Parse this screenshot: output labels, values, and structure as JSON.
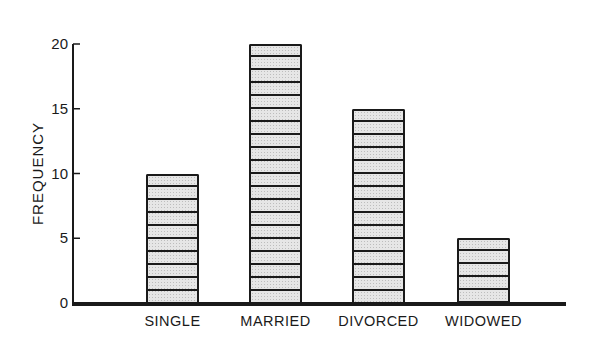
{
  "chart_data": {
    "type": "bar",
    "title": "",
    "xlabel": "",
    "ylabel": "FREQUENCY",
    "categories": [
      "SINGLE",
      "MARRIED",
      "DIVORCED",
      "WIDOWED"
    ],
    "values": [
      10,
      20,
      15,
      5
    ],
    "ylim": [
      0,
      20
    ],
    "yticks": [
      0,
      5,
      10,
      15,
      20
    ],
    "ytick_labels": [
      "0",
      "5",
      "10",
      "15",
      "20"
    ],
    "grid": false,
    "legend": null,
    "bar_style": "stippled gray fill with horizontal line at each unit"
  },
  "colors": {
    "ink": "#1a1a1a",
    "bar_fill": "#e6e6e6",
    "background": "#ffffff"
  }
}
